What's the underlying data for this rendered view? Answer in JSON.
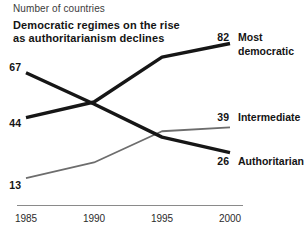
{
  "chart_data": {
    "type": "line",
    "title": "Democratic regimes on the rise as authoritarianism declines",
    "title_lines": [
      "Democratic regimes on the rise",
      "as authoritarianism declines"
    ],
    "ylabel": "Number of countries",
    "xlabel": "",
    "x": [
      1985,
      1990,
      1995,
      2000
    ],
    "x_tick_labels": [
      "1985",
      "1990",
      "1995",
      "2000"
    ],
    "ylim": [
      0,
      90
    ],
    "grid": false,
    "legend_position": "labels at right line ends",
    "value_labels": "line endpoints only",
    "series": [
      {
        "name": "Most democratic",
        "name_lines": [
          "Most",
          "democratic"
        ],
        "values": [
          44,
          52,
          75,
          82
        ],
        "start_label": "44",
        "end_label": "82",
        "color": "#161616",
        "stroke_width": 3.4,
        "start_label_dy": 5,
        "end_label_dy": -7
      },
      {
        "name": "Intermediate",
        "name_lines": [
          "Intermediate"
        ],
        "values": [
          13,
          21,
          37,
          39
        ],
        "start_label": "13",
        "end_label": "39",
        "color": "#6d6d6d",
        "stroke_width": 1.8,
        "start_label_dy": 7,
        "end_label_dy": -10
      },
      {
        "name": "Authoritarian",
        "name_lines": [
          "Authoritarian"
        ],
        "values": [
          67,
          51,
          34,
          26
        ],
        "start_label": "67",
        "end_label": "26",
        "color": "#161616",
        "stroke_width": 3.4,
        "start_label_dy": -6,
        "end_label_dy": 8
      }
    ],
    "axis_color": "#8a8a8a",
    "background_color": "#ffffff"
  }
}
